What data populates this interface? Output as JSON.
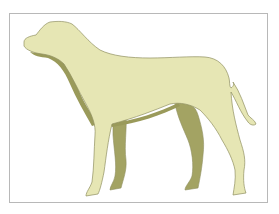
{
  "illustration": {
    "subject": "dog-silhouette",
    "colors": {
      "body": "#e6e6b4",
      "shadow": "#9a9a5a",
      "far_legs": "#a3a363",
      "outline": "#8f8f60",
      "frame": "#b8b8b8",
      "background": "#ffffff"
    }
  }
}
